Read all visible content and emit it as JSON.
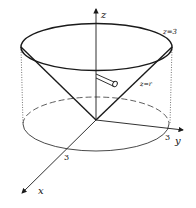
{
  "figure": {
    "axes": {
      "x_label": "x",
      "y_label": "y",
      "z_label": "z"
    },
    "tick_labels": {
      "x_tick": "3",
      "y_tick": "3"
    },
    "annotations": {
      "plane_label": "z=3",
      "cone_label": "z=r"
    },
    "colors": {
      "stroke": "#1a1a1a",
      "background": "#ffffff"
    }
  }
}
